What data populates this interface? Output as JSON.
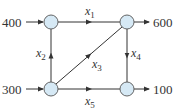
{
  "diagram": {
    "type": "network-flow",
    "node_fill": "#d6e9f5",
    "node_stroke": "#555555",
    "edge_color": "#333333",
    "nodes": [
      {
        "id": "A",
        "position": "top-left"
      },
      {
        "id": "B",
        "position": "top-right"
      },
      {
        "id": "C",
        "position": "bottom-left"
      },
      {
        "id": "D",
        "position": "bottom-right"
      }
    ],
    "external_flows": [
      {
        "label": "400",
        "node": "A",
        "direction": "in"
      },
      {
        "label": "600",
        "node": "B",
        "direction": "out"
      },
      {
        "label": "300",
        "node": "C",
        "direction": "in"
      },
      {
        "label": "100",
        "node": "D",
        "direction": "out"
      }
    ],
    "edges": [
      {
        "var": "x",
        "sub": "1",
        "from": "A",
        "to": "B"
      },
      {
        "var": "x",
        "sub": "2",
        "from": "C",
        "to": "A"
      },
      {
        "var": "x",
        "sub": "3",
        "from": "C",
        "to": "B"
      },
      {
        "var": "x",
        "sub": "4",
        "from": "B",
        "to": "D"
      },
      {
        "var": "x",
        "sub": "5",
        "from": "C",
        "to": "D"
      }
    ]
  }
}
